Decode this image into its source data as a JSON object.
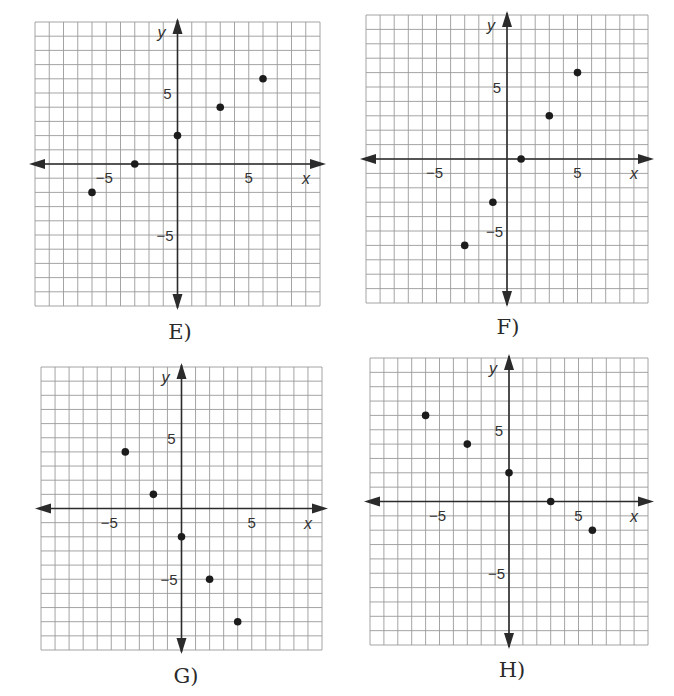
{
  "chart_data": [
    {
      "id": "E",
      "type": "scatter",
      "title": "E)",
      "xlabel": "x",
      "ylabel": "y",
      "xlim": [
        -10,
        10
      ],
      "ylim": [
        -10,
        10
      ],
      "grid": true,
      "tick_labels": {
        "x": [
          "-5",
          "5"
        ],
        "y": [
          "5",
          "-5"
        ]
      },
      "points": [
        [
          -6,
          -2
        ],
        [
          -3,
          0
        ],
        [
          0,
          2
        ],
        [
          3,
          4
        ],
        [
          6,
          6
        ]
      ],
      "layout": {
        "left": 35,
        "top": 22,
        "right": 320,
        "bottom": 306,
        "caption_x": 180,
        "caption_y": 320
      }
    },
    {
      "id": "F",
      "type": "scatter",
      "title": "F)",
      "xlabel": "x",
      "ylabel": "y",
      "xlim": [
        -10,
        10
      ],
      "ylim": [
        -10,
        10
      ],
      "grid": true,
      "tick_labels": {
        "x": [
          "-5",
          "5"
        ],
        "y": [
          "5",
          "-5"
        ]
      },
      "points": [
        [
          -3,
          -6
        ],
        [
          -1,
          -3
        ],
        [
          1,
          0
        ],
        [
          3,
          3
        ],
        [
          5,
          6
        ]
      ],
      "layout": {
        "left": 366,
        "top": 15,
        "right": 648,
        "bottom": 303,
        "caption_x": 508,
        "caption_y": 315
      }
    },
    {
      "id": "G",
      "type": "scatter",
      "title": "G)",
      "xlabel": "x",
      "ylabel": "y",
      "xlim": [
        -10,
        10
      ],
      "ylim": [
        -10,
        10
      ],
      "grid": true,
      "tick_labels": {
        "x": [
          "-5",
          "5"
        ],
        "y": [
          "5",
          "-5"
        ]
      },
      "points": [
        [
          -4,
          4
        ],
        [
          -2,
          1
        ],
        [
          0,
          -2
        ],
        [
          2,
          -5
        ],
        [
          4,
          -8
        ]
      ],
      "layout": {
        "left": 41,
        "top": 367,
        "right": 322,
        "bottom": 650,
        "caption_x": 186,
        "caption_y": 664
      }
    },
    {
      "id": "H",
      "type": "scatter",
      "title": "H)",
      "xlabel": "x",
      "ylabel": "y",
      "xlim": [
        -10,
        10
      ],
      "ylim": [
        -10,
        10
      ],
      "grid": true,
      "tick_labels": {
        "x": [
          "-5",
          "5"
        ],
        "y": [
          "5",
          "-5"
        ]
      },
      "points": [
        [
          -6,
          6
        ],
        [
          -3,
          4
        ],
        [
          0,
          2
        ],
        [
          3,
          0
        ],
        [
          6,
          -2
        ]
      ],
      "layout": {
        "left": 370,
        "top": 358,
        "right": 648,
        "bottom": 645,
        "caption_x": 512,
        "caption_y": 658
      }
    }
  ],
  "captions": {
    "E": "E)",
    "F": "F)",
    "G": "G)",
    "H": "H)"
  }
}
